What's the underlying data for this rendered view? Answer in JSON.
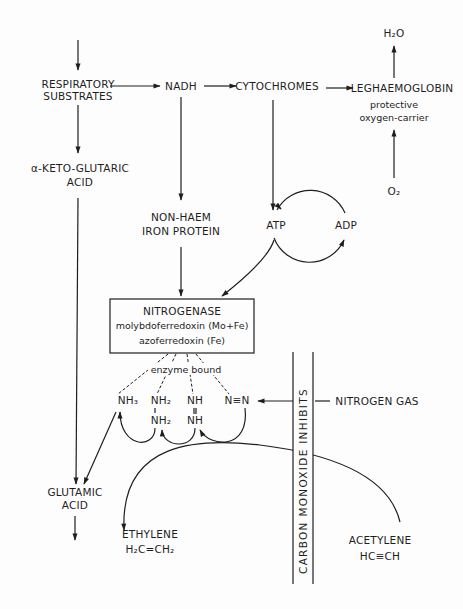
{
  "diagram": {
    "nodes": {
      "respiratory_substrates": [
        "RESPIRATORY",
        "SUBSTRATES"
      ],
      "nadh": "NADH",
      "cytochromes": "CYTOCHROMES",
      "leghaemoglobin": "LEGHAEMOGLOBIN",
      "leghaemoglobin_note": [
        "protective",
        "oxygen-carrier"
      ],
      "water": "H₂O",
      "oxygen": "O₂",
      "alpha_keto": [
        "α-KETO-GLUTARIC",
        "ACID"
      ],
      "non_haem": [
        "NON-HAEM",
        "IRON PROTEIN"
      ],
      "atp": "ATP",
      "adp": "ADP",
      "nitrogenase": [
        "NITROGENASE",
        "molybdoferredoxin (Mo+Fe)",
        "azoferredoxin (Fe)"
      ],
      "enzyme_bound": "enzyme bound",
      "nh3": "NH₃",
      "hydrazine": [
        "NH₂",
        "NH₂"
      ],
      "diimide": [
        "NH",
        "NH"
      ],
      "dinitrogen": "N≡N",
      "nitrogen_gas": "NITROGEN GAS",
      "glutamic": [
        "GLUTAMIC",
        "ACID"
      ],
      "ethylene": [
        "ETHYLENE",
        "H₂C=CH₂"
      ],
      "acetylene": [
        "ACETYLENE",
        "HC≡CH"
      ],
      "inhibitor_bar": "CARBON MONOXIDE INHIBITS"
    },
    "edges": [
      {
        "from": "input",
        "to": "respiratory_substrates"
      },
      {
        "from": "respiratory_substrates",
        "to": "nadh"
      },
      {
        "from": "nadh",
        "to": "cytochromes"
      },
      {
        "from": "cytochromes",
        "to": "leghaemoglobin"
      },
      {
        "from": "leghaemoglobin",
        "to": "water"
      },
      {
        "from": "oxygen",
        "to": "leghaemoglobin"
      },
      {
        "from": "respiratory_substrates",
        "to": "alpha_keto"
      },
      {
        "from": "alpha_keto",
        "to": "glutamic"
      },
      {
        "from": "nadh",
        "to": "non_haem"
      },
      {
        "from": "non_haem",
        "to": "nitrogenase"
      },
      {
        "from": "cytochromes",
        "to": "atp"
      },
      {
        "from": "atp",
        "to": "adp"
      },
      {
        "from": "adp",
        "to": "atp"
      },
      {
        "from": "atp",
        "to": "nitrogenase"
      },
      {
        "from": "nitrogen_gas",
        "to": "dinitrogen"
      },
      {
        "from": "dinitrogen",
        "to": "diimide"
      },
      {
        "from": "diimide",
        "to": "hydrazine"
      },
      {
        "from": "hydrazine",
        "to": "nh3"
      },
      {
        "from": "nh3",
        "to": "glutamic"
      },
      {
        "from": "acetylene",
        "to": "ethylene"
      },
      {
        "from": "glutamic",
        "to": "output"
      }
    ]
  }
}
